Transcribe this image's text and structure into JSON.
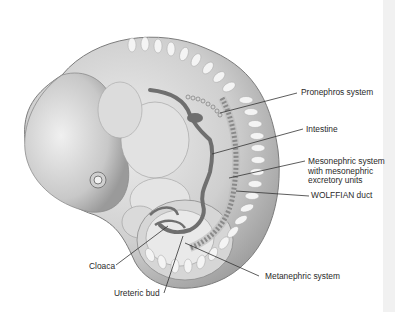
{
  "figure": {
    "labels": {
      "pronephros": "Pronephros system",
      "intestine": "Intestine",
      "mesonephric_1": "Mesonephric system",
      "mesonephric_2": "with mesonephric",
      "mesonephric_3": "excretory units",
      "wolffian": "WOLFFIAN duct",
      "cloaca": "Cloaca",
      "metanephric": "Metanephric system",
      "ureteric": "Ureteric bud"
    },
    "colors": {
      "background": "#ffffff",
      "body_light": "#e6e6e6",
      "body_mid": "#bdbdbd",
      "body_dark": "#8a8a8a",
      "duct": "#6f6f6f",
      "leader_line": "#333333"
    }
  }
}
